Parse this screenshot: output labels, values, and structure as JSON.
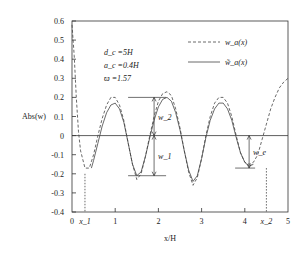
{
  "chart_data": {
    "type": "line",
    "title": "",
    "xlabel": "x/H",
    "ylabel": "Abs(w)",
    "xlim": [
      0,
      5
    ],
    "ylim": [
      -0.4,
      0.6
    ],
    "x_ticks": [
      0,
      1,
      2,
      3,
      4,
      5
    ],
    "x_tick_labels": [
      "0",
      "1",
      "2",
      "3",
      "4",
      "5"
    ],
    "y_ticks": [
      -0.4,
      -0.3,
      -0.2,
      -0.1,
      0,
      0.1,
      0.2,
      0.3,
      0.4,
      0.5,
      0.6
    ],
    "y_tick_labels": [
      "-0.4",
      "-0.3",
      "-0.2",
      "-0.1",
      "0",
      "0.1",
      "0.2",
      "0.3",
      "0.4",
      "0.5",
      "0.6"
    ],
    "grid": false,
    "legend_position": "top-right",
    "parameters": [
      "d_c =5H",
      "a_c =0.4H",
      "ϖ =1.57"
    ],
    "series": [
      {
        "name": "w_a(x)",
        "style": "dashed",
        "x": [
          0.0,
          0.05,
          0.1,
          0.15,
          0.2,
          0.3,
          0.4,
          0.5,
          0.6,
          0.7,
          0.8,
          0.9,
          1.0,
          1.1,
          1.2,
          1.3,
          1.4,
          1.5,
          1.6,
          1.7,
          1.8,
          1.9,
          2.0,
          2.1,
          2.2,
          2.3,
          2.4,
          2.5,
          2.6,
          2.7,
          2.8,
          2.9,
          3.0,
          3.1,
          3.2,
          3.3,
          3.4,
          3.5,
          3.6,
          3.7,
          3.8,
          3.9,
          4.0,
          4.1,
          4.2,
          4.3,
          4.4,
          4.5,
          4.6,
          4.7,
          4.8,
          4.9,
          5.0
        ],
        "y": [
          0.58,
          0.42,
          0.2,
          0.02,
          -0.08,
          -0.17,
          -0.17,
          -0.1,
          0.0,
          0.09,
          0.16,
          0.2,
          0.2,
          0.16,
          0.08,
          -0.04,
          -0.15,
          -0.23,
          -0.2,
          -0.11,
          0.0,
          0.1,
          0.18,
          0.22,
          0.23,
          0.21,
          0.14,
          0.04,
          -0.08,
          -0.19,
          -0.26,
          -0.22,
          -0.12,
          0.0,
          0.1,
          0.17,
          0.2,
          0.2,
          0.17,
          0.1,
          0.0,
          -0.09,
          -0.14,
          -0.15,
          -0.14,
          -0.1,
          -0.02,
          0.06,
          0.14,
          0.2,
          0.25,
          0.28,
          0.3
        ]
      },
      {
        "name": "w̃_a(x)",
        "style": "solid",
        "x": [
          0.45,
          0.5,
          0.6,
          0.7,
          0.8,
          0.9,
          1.0,
          1.1,
          1.2,
          1.3,
          1.4,
          1.5,
          1.6,
          1.7,
          1.8,
          1.9,
          2.0,
          2.1,
          2.2,
          2.3,
          2.4,
          2.5,
          2.6,
          2.7,
          2.8,
          2.9,
          3.0,
          3.1,
          3.2,
          3.3,
          3.4,
          3.5,
          3.6,
          3.7,
          3.8,
          3.9,
          4.0,
          4.1,
          4.2
        ],
        "y": [
          -0.17,
          -0.13,
          -0.04,
          0.05,
          0.12,
          0.16,
          0.17,
          0.14,
          0.07,
          -0.04,
          -0.15,
          -0.21,
          -0.19,
          -0.11,
          -0.01,
          0.08,
          0.15,
          0.19,
          0.2,
          0.18,
          0.12,
          0.03,
          -0.08,
          -0.18,
          -0.24,
          -0.21,
          -0.12,
          -0.01,
          0.08,
          0.14,
          0.17,
          0.17,
          0.14,
          0.08,
          -0.01,
          -0.09,
          -0.14,
          -0.16,
          -0.15
        ]
      }
    ],
    "annotations": [
      {
        "label": "w_1",
        "x": 1.9,
        "from": 0,
        "to": -0.21
      },
      {
        "label": "w_2",
        "x": 1.9,
        "from": 0,
        "to": 0.2
      },
      {
        "label": "w_e",
        "x": 4.1,
        "from": 0,
        "to": -0.17
      },
      {
        "label": "x_1",
        "x": 0.3,
        "marker": "dotted-vertical",
        "y_top": -0.2
      },
      {
        "label": "x_2",
        "x": 4.5,
        "marker": "dotted-vertical",
        "y_top": -0.17
      }
    ],
    "legend": [
      {
        "label": "w_a(x)",
        "style": "dashed"
      },
      {
        "label": "w̃_a(x)",
        "style": "solid"
      }
    ]
  }
}
